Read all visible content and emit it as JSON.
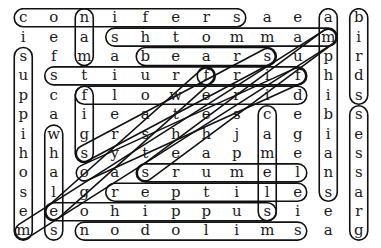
{
  "puzzle": {
    "rows": 12,
    "cols": 12,
    "grid": [
      [
        "c",
        "o",
        "n",
        "i",
        "f",
        "e",
        "r",
        "s",
        "a",
        "e",
        "a",
        "b"
      ],
      [
        "i",
        "e",
        "a",
        "s",
        "h",
        "t",
        "o",
        "m",
        "m",
        "a",
        "m",
        "i"
      ],
      [
        "s",
        "f",
        "m",
        "a",
        "b",
        "e",
        "a",
        "r",
        "s",
        "u",
        "p",
        "r"
      ],
      [
        "u",
        "s",
        "t",
        "i",
        "u",
        "r",
        "f",
        "r",
        "i",
        "f",
        "h",
        "d"
      ],
      [
        "p",
        "c",
        "f",
        "l",
        "o",
        "w",
        "e",
        "r",
        "i",
        "d",
        "i",
        "s"
      ],
      [
        "p",
        "a",
        "i",
        "e",
        "a",
        "t",
        "e",
        "s",
        "c",
        "e",
        "b",
        "s"
      ],
      [
        "i",
        "w",
        "g",
        "r",
        "s",
        "h",
        "h",
        "j",
        "a",
        "g",
        "i",
        "e"
      ],
      [
        "h",
        "h",
        "s",
        "y",
        "t",
        "e",
        "a",
        "p",
        "m",
        "e",
        "a",
        "s"
      ],
      [
        "o",
        "a",
        "o",
        "a",
        "s",
        "r",
        "u",
        "m",
        "e",
        "l",
        "n",
        "s"
      ],
      [
        "s",
        "l",
        "g",
        "r",
        "e",
        "p",
        "t",
        "i",
        "l",
        "e",
        "s",
        "a"
      ],
      [
        "e",
        "e",
        "o",
        "h",
        "i",
        "p",
        "p",
        "u",
        "s",
        "i",
        "e",
        "r"
      ],
      [
        "m",
        "s",
        "n",
        "o",
        "d",
        "o",
        "l",
        "i",
        "m",
        "s",
        "a",
        "g"
      ]
    ],
    "found_words": [
      {
        "word": "conifers",
        "start": [
          0,
          0
        ],
        "end": [
          0,
          7
        ]
      },
      {
        "word": "mammoths",
        "start": [
          1,
          10
        ],
        "end": [
          1,
          3
        ]
      },
      {
        "word": "bears",
        "start": [
          2,
          4
        ],
        "end": [
          2,
          8
        ]
      },
      {
        "word": "fruits",
        "start": [
          3,
          6
        ],
        "end": [
          3,
          1
        ]
      },
      {
        "word": "frif",
        "start": [
          3,
          6
        ],
        "end": [
          3,
          9
        ]
      },
      {
        "word": "flowerid",
        "start": [
          4,
          2
        ],
        "end": [
          4,
          9
        ]
      },
      {
        "word": "lemurs",
        "start": [
          8,
          9
        ],
        "end": [
          8,
          4
        ]
      },
      {
        "word": "reptile",
        "start": [
          9,
          3
        ],
        "end": [
          9,
          9
        ]
      },
      {
        "word": "eohippus",
        "start": [
          10,
          1
        ],
        "end": [
          10,
          8
        ]
      },
      {
        "word": "smilodon",
        "start": [
          11,
          9
        ],
        "end": [
          11,
          2
        ]
      },
      {
        "word": "man",
        "start": [
          2,
          2
        ],
        "end": [
          0,
          2
        ]
      },
      {
        "word": "figs",
        "start": [
          4,
          2
        ],
        "end": [
          7,
          2
        ]
      },
      {
        "word": "mesohippus",
        "start": [
          11,
          0
        ],
        "end": [
          2,
          0
        ]
      },
      {
        "word": "whales",
        "start": [
          6,
          1
        ],
        "end": [
          11,
          1
        ]
      },
      {
        "word": "camels",
        "start": [
          5,
          8
        ],
        "end": [
          10,
          8
        ]
      },
      {
        "word": "amphibians",
        "start": [
          0,
          10
        ],
        "end": [
          9,
          10
        ]
      },
      {
        "word": "birds",
        "start": [
          0,
          11
        ],
        "end": [
          4,
          11
        ]
      },
      {
        "word": "grasses",
        "start": [
          11,
          11
        ],
        "end": [
          5,
          11
        ]
      },
      {
        "word": "diag-1",
        "start": [
          11,
          0
        ],
        "end": [
          1,
          10
        ]
      },
      {
        "word": "diag-2",
        "start": [
          7,
          2
        ],
        "end": [
          2,
          8
        ]
      },
      {
        "word": "diag-3",
        "start": [
          8,
          2
        ],
        "end": [
          3,
          9
        ]
      },
      {
        "word": "diag-4",
        "start": [
          10,
          1
        ],
        "end": [
          3,
          6
        ]
      },
      {
        "word": "diag-5",
        "start": [
          8,
          4
        ],
        "end": [
          1,
          10
        ]
      }
    ]
  }
}
